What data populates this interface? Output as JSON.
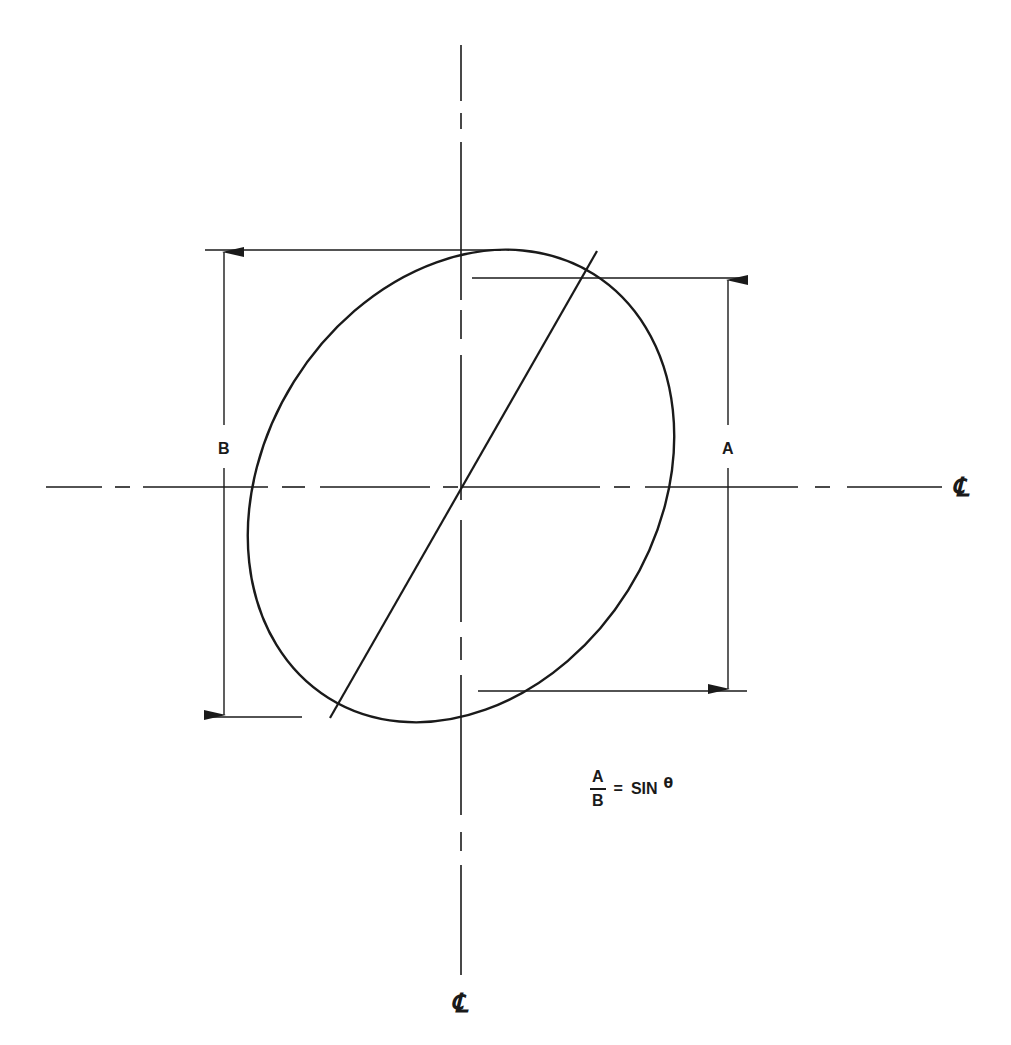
{
  "diagram": {
    "type": "engineering-drawing",
    "colors": {
      "line": "#1a1a1a",
      "background": "#ffffff"
    },
    "centerline_symbol": "℄",
    "labels": {
      "dimension_b": "B",
      "dimension_a": "A",
      "centerline_horizontal": "℄",
      "centerline_vertical": "℄"
    },
    "formula": {
      "numerator": "A",
      "denominator": "B",
      "equals": "=",
      "function": "SIN",
      "variable": "θ",
      "text": "A/B = SIN θ"
    },
    "geometry": {
      "center": [
        461,
        486
      ],
      "ellipse_semi_major": 250,
      "ellipse_semi_minor": 197,
      "ellipse_rotation_deg": -58,
      "chord": {
        "from": [
          330,
          718
        ],
        "to": [
          597,
          251
        ]
      },
      "dimension_B": {
        "top_y": 250,
        "bottom_y": 717,
        "x": 224
      },
      "dimension_A": {
        "top_y": 278,
        "bottom_y": 691,
        "x": 728
      }
    }
  }
}
